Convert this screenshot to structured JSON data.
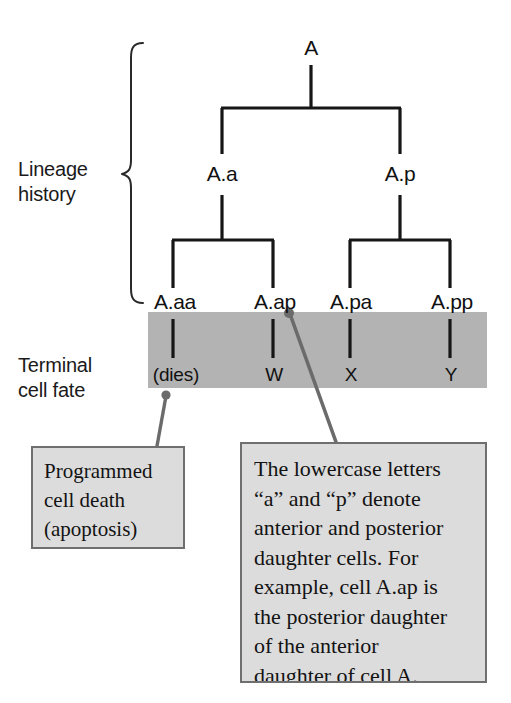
{
  "figure": {
    "background_color": "#ffffff",
    "band_color": "#b3b3b3",
    "callout_fill": "#dcdcdc",
    "callout_border": "#6f6f6f",
    "leader_color": "#6b6b6b",
    "line_color": "#1a1a1a"
  },
  "side_labels": {
    "lineage_history": "Lineage\nhistory",
    "terminal_cell_fate": "Terminal\ncell fate"
  },
  "lineage": {
    "root": {
      "label": "A",
      "x": 311
    },
    "generation_2": [
      {
        "label": "A.a",
        "x": 222
      },
      {
        "label": "A.p",
        "x": 400
      }
    ],
    "generation_3": [
      {
        "label": "A.aa",
        "x": 173
      },
      {
        "label": "A.ap",
        "x": 273
      },
      {
        "label": "A.pa",
        "x": 350
      },
      {
        "label": "A.pp",
        "x": 450
      }
    ]
  },
  "terminal_fates": [
    {
      "cell": "A.aa",
      "fate": "(dies)",
      "x": 175
    },
    {
      "cell": "A.ap",
      "fate": "W",
      "x": 273
    },
    {
      "cell": "A.pa",
      "fate": "X",
      "x": 350
    },
    {
      "cell": "A.pp",
      "fate": "Y",
      "x": 450
    }
  ],
  "callouts": {
    "apoptosis": {
      "text": "Programmed\ncell death\n(apoptosis)",
      "anchor_cell": "A.aa"
    },
    "nomenclature": {
      "text": "The lowercase letters\n“a” and “p” denote\nanterior and posterior\ndaughter cells. For\nexample, cell A.ap is\nthe posterior daughter\nof the anterior\ndaughter of cell A.",
      "anchor_cell": "A.ap"
    }
  },
  "caption": {
    "text": ""
  }
}
